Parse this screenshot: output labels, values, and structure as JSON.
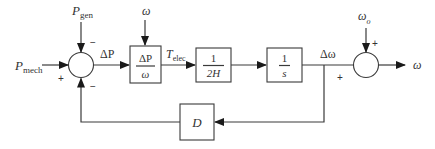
{
  "diagram": {
    "inputs": {
      "p_mech": {
        "main": "P",
        "sub": "mech"
      },
      "p_gen": {
        "main": "P",
        "sub": "gen"
      },
      "omega_in": "ω",
      "omega_o": {
        "main": "ω",
        "sub": "o"
      }
    },
    "signals": {
      "delta_p": "ΔP",
      "t_elec": {
        "main": "T",
        "sub": "elec"
      },
      "delta_omega": "Δω",
      "omega_out": "ω"
    },
    "blocks": {
      "torque_block": {
        "num": "ΔP",
        "den": "ω"
      },
      "inertia_block": {
        "num": "1",
        "den": "2H"
      },
      "integrator_block": {
        "num": "1",
        "den": "s"
      },
      "damping_block": {
        "label": "D"
      }
    },
    "junction1_signs": {
      "left": "+",
      "top": "−",
      "bottom": "−"
    },
    "junction2_signs": {
      "left": "+",
      "top": "+"
    },
    "colors": {
      "line": "#3a3a3a",
      "background": "#ffffff"
    }
  }
}
